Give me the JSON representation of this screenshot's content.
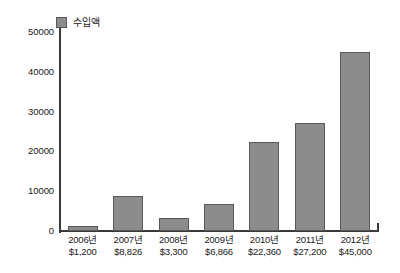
{
  "chart_data": {
    "type": "bar",
    "title": "",
    "xlabel": "",
    "ylabel": "",
    "grid": false,
    "legend_position": "top-left",
    "ylim": [
      0,
      50000
    ],
    "yticks": [
      50000,
      40000,
      30000,
      20000,
      10000,
      0
    ],
    "ytick_labels": [
      "50000",
      "40000",
      "30000",
      "20000",
      "10000",
      "0"
    ],
    "categories": [
      "2006년",
      "2007년",
      "2008년",
      "2009년",
      "2010년",
      "2011년",
      "2012년"
    ],
    "value_labels": [
      "$1,200",
      "$8,826",
      "$3,300",
      "$6,866",
      "$22,360",
      "$27,200",
      "$45,000"
    ],
    "series": [
      {
        "name": "수입액",
        "color": "#8c8c8c",
        "values": [
          1200,
          8826,
          3300,
          6866,
          22360,
          27200,
          45000
        ]
      }
    ]
  },
  "legend": {
    "items": [
      {
        "label": "수입액",
        "color": "#8c8c8c"
      }
    ]
  },
  "axes": {
    "axis_color": "#3a3a3a"
  }
}
